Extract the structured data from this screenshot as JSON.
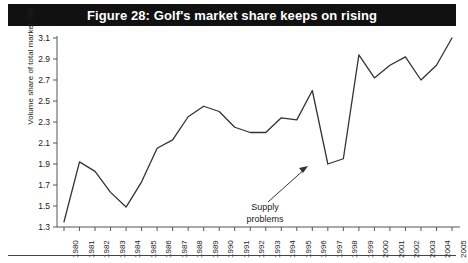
{
  "title": "Figure 28: Golf's market share keeps on rising",
  "annotation": {
    "line1": "Supply",
    "line2": "problems"
  },
  "colors": {
    "title_bar_bg": "#111111",
    "title_text": "#ffffff",
    "line": "#333333",
    "axis": "#555555",
    "text": "#1a1a1a",
    "page_bg": "#ffffff"
  },
  "chart_data": {
    "type": "line",
    "title": "Figure 28: Golf's market share keeps on rising",
    "xlabel": "",
    "ylabel": "Volume share of total market (%)",
    "ylim": [
      1.3,
      3.1
    ],
    "yticks": [
      "1.3",
      "1.5",
      "1.7",
      "1.9",
      "2.1",
      "2.3",
      "2.5",
      "2.7",
      "2.9",
      "3.1"
    ],
    "grid": false,
    "legend": "none",
    "categories": [
      "1980",
      "1981",
      "1982",
      "1983",
      "1984",
      "1985",
      "1986",
      "1987",
      "1988",
      "1989",
      "1990",
      "1991",
      "1992",
      "1993",
      "1994",
      "1995",
      "1996",
      "1997",
      "1998",
      "1999",
      "2000",
      "2001",
      "2002",
      "2003",
      "2004",
      "2005"
    ],
    "series": [
      {
        "name": "Volume share of total market (%)",
        "values": [
          1.35,
          1.92,
          1.83,
          1.63,
          1.49,
          1.73,
          2.05,
          2.13,
          2.35,
          2.45,
          2.4,
          2.25,
          2.2,
          2.2,
          2.34,
          2.32,
          2.6,
          1.9,
          1.95,
          2.94,
          2.72,
          2.84,
          2.92,
          2.7,
          2.84,
          3.1
        ]
      }
    ],
    "annotations": [
      {
        "text": "Supply problems",
        "points_to_year": "1997",
        "points_to_value": 1.9
      }
    ]
  }
}
